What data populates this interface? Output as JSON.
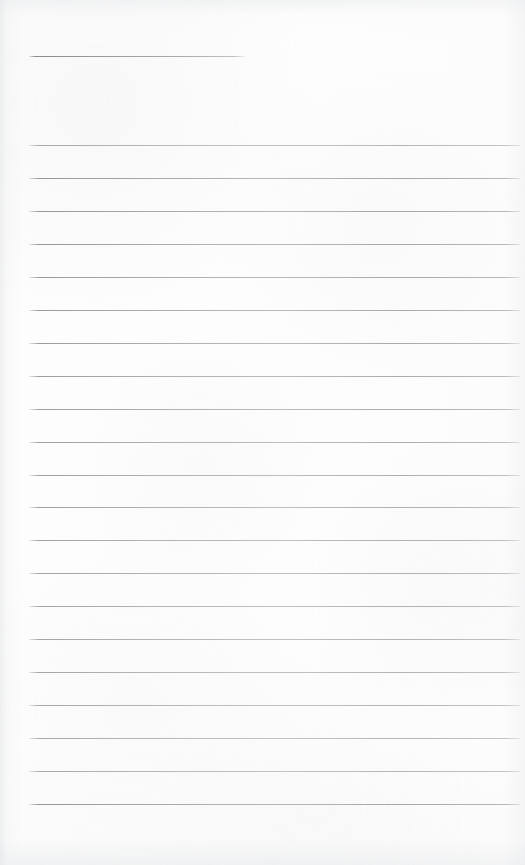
{
  "document": {
    "kind": "ruled-notebook-page-scan",
    "title_line_present": true,
    "background_color": "#fdfdfd",
    "rule_color": "#8e9095",
    "page": {
      "width": 525,
      "height": 865
    }
  },
  "header_rule": {
    "name": "title-underline",
    "x_start": 29,
    "x_end": 245,
    "y": 56,
    "thickness": 1
  },
  "body_rules": {
    "count": 21,
    "x_start": 29,
    "x_end": 520,
    "y_first": 145,
    "y_last": 804,
    "spacing": 32.95,
    "thickness": 1,
    "y_positions": [
      145,
      178,
      211,
      244,
      277,
      310,
      343,
      376,
      409,
      442,
      475,
      507,
      540,
      573,
      606,
      639,
      672,
      705,
      738,
      771,
      804
    ]
  },
  "margins": {
    "top_blank_height": 56,
    "bottom_blank_height": 61,
    "left": 29,
    "right": 5
  },
  "written_content": {
    "text": "",
    "note": "page is blank — no handwriting or printed text present"
  }
}
